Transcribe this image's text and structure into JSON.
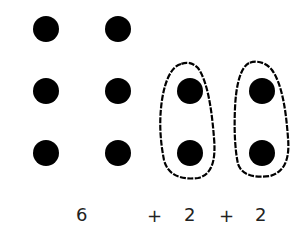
{
  "diagram": {
    "dot_color": "#000000",
    "dot_radius": 13,
    "left_grid": [
      {
        "x": 46,
        "y": 29
      },
      {
        "x": 118,
        "y": 29
      },
      {
        "x": 46,
        "y": 91
      },
      {
        "x": 118,
        "y": 91
      },
      {
        "x": 46,
        "y": 153
      },
      {
        "x": 118,
        "y": 153
      }
    ],
    "groups": [
      {
        "dots": [
          {
            "x": 190,
            "y": 91
          },
          {
            "x": 190,
            "y": 153
          }
        ]
      },
      {
        "dots": [
          {
            "x": 262,
            "y": 91
          },
          {
            "x": 262,
            "y": 153
          }
        ]
      }
    ]
  },
  "expression": {
    "term1": "6",
    "op1": "+",
    "term2": "2",
    "op2": "+",
    "term3": "2"
  }
}
